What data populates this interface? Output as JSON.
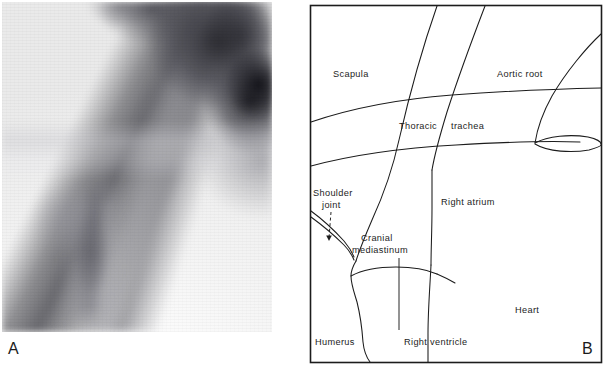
{
  "figure": {
    "panels": [
      {
        "letter": "A",
        "type": "radiograph",
        "caption": ""
      },
      {
        "letter": "B",
        "type": "line-diagram",
        "caption": ""
      }
    ]
  },
  "panel_a": {
    "letter": "A",
    "description": "radiograph"
  },
  "panel_b": {
    "letter": "B",
    "labels": [
      {
        "id": "scapula",
        "text": "Scapula",
        "x": 333,
        "y": 77,
        "anchor": "start"
      },
      {
        "id": "aortic-root",
        "text": "Aortic root",
        "x": 497,
        "y": 77,
        "anchor": "start"
      },
      {
        "id": "thoracic",
        "text": "Thoracic",
        "x": 399,
        "y": 129,
        "anchor": "start"
      },
      {
        "id": "trachea",
        "text": "trachea",
        "x": 451,
        "y": 129,
        "anchor": "start"
      },
      {
        "id": "shoulder",
        "text": "Shoulder",
        "x": 313,
        "y": 196,
        "anchor": "start"
      },
      {
        "id": "joint",
        "text": "joint",
        "x": 322,
        "y": 208,
        "anchor": "start"
      },
      {
        "id": "right-atrium",
        "text": "Right atrium",
        "x": 441,
        "y": 205,
        "anchor": "start"
      },
      {
        "id": "cranial",
        "text": "Cranial",
        "x": 361,
        "y": 241,
        "anchor": "start"
      },
      {
        "id": "mediastinum",
        "text": "mediastinum",
        "x": 352,
        "y": 253,
        "anchor": "start"
      },
      {
        "id": "heart",
        "text": "Heart",
        "x": 515,
        "y": 313,
        "anchor": "start"
      },
      {
        "id": "humerus",
        "text": "Humerus",
        "x": 315,
        "y": 345,
        "anchor": "start"
      },
      {
        "id": "right-ventricle",
        "text": "Right ventricle",
        "x": 404,
        "y": 345,
        "anchor": "start"
      }
    ],
    "colors": {
      "line": "#1c1c1c",
      "text": "#1c1c1c",
      "background": "#ffffff"
    }
  }
}
